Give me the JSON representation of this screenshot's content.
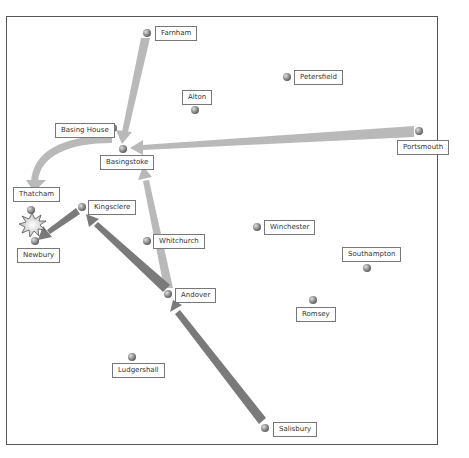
{
  "colors": {
    "light_arrow": "#b9b9b9",
    "dark_arrow": "#7a7a7a",
    "town_dot": "#8a8a8a",
    "frame": "#555555"
  },
  "towns": [
    {
      "id": "farnham",
      "name": "Farnham",
      "dot": [
        147,
        33
      ],
      "label": [
        155,
        26
      ]
    },
    {
      "id": "alton",
      "name": "Alton",
      "dot": [
        195,
        110
      ],
      "label": [
        182,
        90
      ]
    },
    {
      "id": "petersfield",
      "name": "Petersfield",
      "dot": [
        287,
        77
      ],
      "label": [
        294,
        70
      ]
    },
    {
      "id": "basing-house",
      "name": "Basing House",
      "dot": [
        113,
        128
      ],
      "label": [
        55,
        123
      ]
    },
    {
      "id": "basingstoke",
      "name": "Basingstoke",
      "dot": [
        123,
        149
      ],
      "label": [
        100,
        155
      ]
    },
    {
      "id": "portsmouth",
      "name": "Portsmouth",
      "dot": [
        419,
        131
      ],
      "label": [
        397,
        140
      ]
    },
    {
      "id": "thatcham",
      "name": "Thatcham",
      "dot": [
        31,
        210
      ],
      "label": [
        13,
        187
      ]
    },
    {
      "id": "kingsclere",
      "name": "Kingsclere",
      "dot": [
        82,
        207
      ],
      "label": [
        88,
        200
      ]
    },
    {
      "id": "newbury",
      "name": "Newbury",
      "dot": [
        35,
        241
      ],
      "label": [
        17,
        248
      ]
    },
    {
      "id": "whitchurch",
      "name": "Whitchurch",
      "dot": [
        147,
        241
      ],
      "label": [
        153,
        234
      ]
    },
    {
      "id": "winchester",
      "name": "Winchester",
      "dot": [
        257,
        227
      ],
      "label": [
        264,
        220
      ]
    },
    {
      "id": "southampton",
      "name": "Southampton",
      "dot": [
        367,
        268
      ],
      "label": [
        342,
        247
      ]
    },
    {
      "id": "andover",
      "name": "Andover",
      "dot": [
        168,
        294
      ],
      "label": [
        175,
        288
      ]
    },
    {
      "id": "romsey",
      "name": "Romsey",
      "dot": [
        313,
        300
      ],
      "label": [
        296,
        307
      ]
    },
    {
      "id": "ludgershall",
      "name": "Ludgershall",
      "dot": [
        132,
        357
      ],
      "label": [
        112,
        363
      ]
    },
    {
      "id": "salisbury",
      "name": "Salisbury",
      "dot": [
        265,
        428
      ],
      "label": [
        273,
        422
      ]
    }
  ],
  "arrows": [
    {
      "id": "farnham-to-basingstoke",
      "style": "light"
    },
    {
      "id": "portsmouth-to-basingstoke",
      "style": "light"
    },
    {
      "id": "basingstoke-to-thatcham",
      "style": "light"
    },
    {
      "id": "andover-to-basingstoke",
      "style": "light"
    },
    {
      "id": "salisbury-to-andover",
      "style": "dark"
    },
    {
      "id": "andover-to-kingsclere",
      "style": "dark"
    },
    {
      "id": "kingsclere-to-newbury",
      "style": "dark"
    }
  ],
  "battle_marker": {
    "name": "battle-explosion",
    "at": [
      32,
      225
    ]
  }
}
